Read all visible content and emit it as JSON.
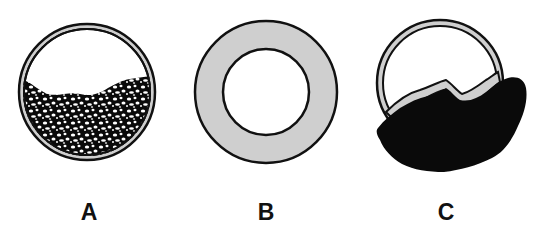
{
  "figure": {
    "panels": [
      {
        "id": "A",
        "label": "A",
        "description": "Circle with thin gray wall, lower portion filled with speckled material (black with white flecks)"
      },
      {
        "id": "B",
        "label": "B",
        "description": "Thick gray ring (annulus) with empty white center"
      },
      {
        "id": "C",
        "label": "C",
        "description": "Circle with thin gray wall, lower portion filled with solid black mass bulging beyond the wall"
      }
    ],
    "colors": {
      "wall_gray": "#cfcfcf",
      "outline": "#111111",
      "fill_black": "#0a0a0a",
      "speckle": "#ffffff",
      "background": "#ffffff"
    }
  }
}
